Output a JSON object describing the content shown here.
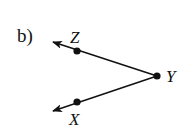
{
  "diagram": {
    "part_label": "b)",
    "type": "angle",
    "vertex": {
      "name": "Y",
      "x": 157,
      "y": 76
    },
    "points": [
      {
        "name": "Z",
        "x": 77,
        "y": 51,
        "label_x": 70,
        "label_y": 43
      },
      {
        "name": "X",
        "x": 77,
        "y": 102,
        "label_x": 69,
        "label_y": 125
      }
    ],
    "rays": [
      {
        "from": "Y",
        "through": "Z",
        "arrow_tip": {
          "x": 52,
          "y": 42
        }
      },
      {
        "from": "Y",
        "through": "X",
        "arrow_tip": {
          "x": 52,
          "y": 111
        }
      }
    ],
    "colors": {
      "stroke": "#111111",
      "background": "#ffffff"
    }
  }
}
